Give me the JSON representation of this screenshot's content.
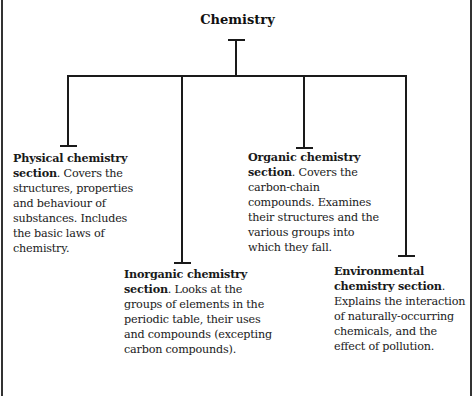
{
  "title": "Chemistry",
  "sections": [
    {
      "heading": "Physical chemistry section",
      "heading_suffix": ".",
      "body": " Covers the structures, properties and behaviour of substances. Includes the basic laws of chemistry."
    },
    {
      "heading": "Inorganic chemistry section",
      "heading_suffix": ".",
      "body": " Looks at the groups of elements in the periodic table, their uses and compounds (excepting carbon compounds)."
    },
    {
      "heading": "Organic chemistry section",
      "heading_suffix": ".",
      "body": " Covers the carbon-chain compounds. Examines their structures and the various groups into which they fall."
    },
    {
      "heading": "Environmental chemistry section",
      "heading_suffix": ".",
      "body": " Explains the interaction of naturally-occurring chemicals, and the effect of pollution."
    }
  ]
}
